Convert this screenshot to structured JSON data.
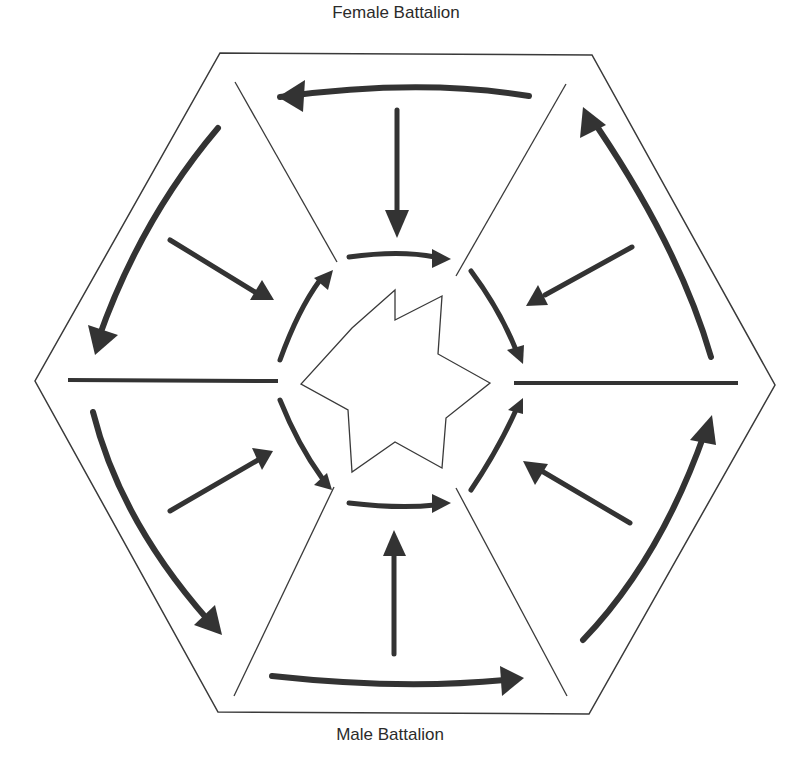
{
  "labels": {
    "top": "Female Battalion",
    "bottom": "Male Battalion"
  },
  "colors": {
    "outline": "#3a3a3a",
    "arrow": "#333333",
    "background": "#ffffff"
  },
  "hexagon": {
    "points": [
      [
        220,
        53
      ],
      [
        592,
        55
      ],
      [
        775,
        385
      ],
      [
        589,
        714
      ],
      [
        218,
        712
      ],
      [
        35,
        381
      ]
    ]
  },
  "dividers": {
    "thin": [
      [
        [
          235,
          82
        ],
        [
          337,
          262
        ]
      ],
      [
        [
          566,
          84
        ],
        [
          456,
          276
        ]
      ],
      [
        [
          234,
          696
        ],
        [
          334,
          487
        ]
      ],
      [
        [
          567,
          696
        ],
        [
          456,
          488
        ]
      ]
    ],
    "thick": [
      [
        [
          68,
          380
        ],
        [
          278,
          381
        ]
      ],
      [
        [
          514,
          383
        ],
        [
          738,
          383
        ]
      ]
    ]
  },
  "star": {
    "points": [
      [
        395,
        290
      ],
      [
        352,
        328
      ],
      [
        301,
        384
      ],
      [
        348,
        410
      ],
      [
        352,
        472
      ],
      [
        395,
        442
      ],
      [
        442,
        468
      ],
      [
        446,
        418
      ],
      [
        490,
        383
      ],
      [
        438,
        354
      ],
      [
        442,
        296
      ],
      [
        395,
        320
      ]
    ]
  },
  "arrows": [
    {
      "name": "top-outer-arrow",
      "d": "M529,96 Q420,78 280,97",
      "width": 6,
      "head": [
        [
          278,
          97
        ],
        [
          305,
          80
        ],
        [
          303,
          112
        ]
      ]
    },
    {
      "name": "top-inward-arrow",
      "d": "M397,110 L397,215",
      "width": 5,
      "head": [
        [
          397,
          238
        ],
        [
          385,
          210
        ],
        [
          409,
          210
        ]
      ]
    },
    {
      "name": "upper-left-outer-arrow",
      "d": "M218,128 Q140,220 98,340",
      "width": 6,
      "head": [
        [
          95,
          355
        ],
        [
          88,
          325
        ],
        [
          118,
          335
        ]
      ]
    },
    {
      "name": "upper-left-inward-arrow",
      "d": "M170,240 L255,292",
      "width": 5,
      "head": [
        [
          274,
          300
        ],
        [
          250,
          300
        ],
        [
          262,
          280
        ]
      ]
    },
    {
      "name": "inner-upper-left-arrow",
      "d": "M280,360 Q298,310 320,280",
      "width": 5,
      "head": [
        [
          333,
          270
        ],
        [
          314,
          278
        ],
        [
          328,
          290
        ]
      ]
    },
    {
      "name": "inner-top-arrow",
      "d": "M349,257 Q400,250 435,257",
      "width": 5,
      "head": [
        [
          451,
          259
        ],
        [
          432,
          249
        ],
        [
          432,
          268
        ]
      ]
    },
    {
      "name": "inner-upper-right-arrow",
      "d": "M471,271 Q500,310 516,350",
      "width": 5,
      "head": [
        [
          523,
          364
        ],
        [
          507,
          350
        ],
        [
          524,
          345
        ]
      ]
    },
    {
      "name": "upper-right-outer-arrow",
      "d": "M711,357 Q680,250 598,128",
      "width": 6,
      "head": [
        [
          583,
          107
        ],
        [
          580,
          138
        ],
        [
          606,
          125
        ]
      ]
    },
    {
      "name": "upper-right-inward-arrow",
      "d": "M632,247 L545,295",
      "width": 5,
      "head": [
        [
          526,
          306
        ],
        [
          538,
          285
        ],
        [
          548,
          305
        ]
      ]
    },
    {
      "name": "inner-lower-left-arrow",
      "d": "M280,400 Q298,445 322,478",
      "width": 5,
      "head": [
        [
          332,
          490
        ],
        [
          314,
          485
        ],
        [
          327,
          473
        ]
      ]
    },
    {
      "name": "inner-bottom-arrow",
      "d": "M349,503 Q400,509 435,505",
      "width": 5,
      "head": [
        [
          451,
          503
        ],
        [
          432,
          494
        ],
        [
          432,
          513
        ]
      ]
    },
    {
      "name": "inner-lower-right-arrow",
      "d": "M471,490 Q498,450 516,410",
      "width": 5,
      "head": [
        [
          523,
          398
        ],
        [
          508,
          410
        ],
        [
          523,
          414
        ]
      ]
    },
    {
      "name": "lower-left-outer-arrow",
      "d": "M93,412 Q120,520 208,620",
      "width": 6,
      "head": [
        [
          222,
          635
        ],
        [
          194,
          625
        ],
        [
          215,
          605
        ]
      ]
    },
    {
      "name": "lower-left-inward-arrow",
      "d": "M170,511 L258,460",
      "width": 5,
      "head": [
        [
          273,
          451
        ],
        [
          252,
          448
        ],
        [
          262,
          470
        ]
      ]
    },
    {
      "name": "lower-right-outer-arrow",
      "d": "M583,640 Q660,560 705,432",
      "width": 6,
      "head": [
        [
          712,
          415
        ],
        [
          690,
          440
        ],
        [
          716,
          445
        ]
      ]
    },
    {
      "name": "lower-right-inward-arrow",
      "d": "M630,523 L540,470",
      "width": 5,
      "head": [
        [
          523,
          461
        ],
        [
          535,
          485
        ],
        [
          548,
          464
        ]
      ]
    },
    {
      "name": "bottom-inward-arrow",
      "d": "M394,654 L394,548",
      "width": 5,
      "head": [
        [
          394,
          530
        ],
        [
          383,
          556
        ],
        [
          406,
          556
        ]
      ]
    },
    {
      "name": "bottom-outer-arrow",
      "d": "M272,676 Q400,690 505,680",
      "width": 6,
      "head": [
        [
          524,
          678
        ],
        [
          500,
          666
        ],
        [
          502,
          696
        ]
      ]
    }
  ]
}
